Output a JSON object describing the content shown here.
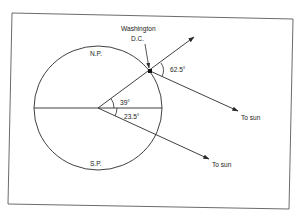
{
  "figure": {
    "labels": {
      "location_line1": "Washington",
      "location_line2": "D.C.",
      "north_pole": "N.P.",
      "south_pole": "S.P.",
      "angle_latitude": "39°",
      "angle_declination": "23.5°",
      "angle_elevation": "62.5°",
      "sun_direction_1": "To sun",
      "sun_direction_2": "To sun"
    },
    "colors": {
      "line": "#2a2a2a",
      "frame": "#5a5a5a",
      "background": "#ffffff"
    }
  }
}
